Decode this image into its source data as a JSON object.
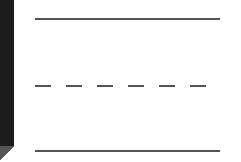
{
  "line_style_picker": {
    "options": [
      {
        "style": "solid",
        "selected": false
      },
      {
        "style": "dashed",
        "selected": false
      },
      {
        "style": "solid",
        "selected": false
      }
    ],
    "stroke_color": "#555555"
  },
  "sidebar": {
    "color": "#1c1c1c"
  }
}
